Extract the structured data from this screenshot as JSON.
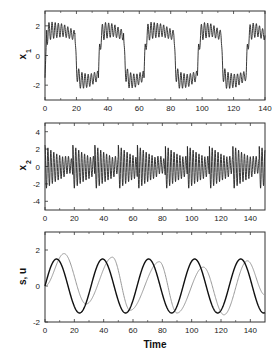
{
  "chart_data": [
    {
      "type": "line",
      "ylabel": "x1",
      "ylabel_main": "x",
      "ylabel_sub": "1",
      "xlabel": "",
      "xlim": [
        0,
        140
      ],
      "ylim": [
        -3,
        3
      ],
      "xticks": [
        0,
        20,
        40,
        60,
        80,
        100,
        120,
        140
      ],
      "yticks": [
        -2,
        0,
        2
      ],
      "frame": {
        "left": 45,
        "top": 11,
        "right": 265,
        "bottom": 100
      },
      "series": [
        {
          "name": "x1",
          "color": "#222222",
          "description": "square-wave-like switching between ~+1.5 and ~-1.5 with fast oscillations; switches near t=19, 34, 50, 63, 82, 97, 112, 128",
          "switch_times": [
            0,
            19,
            34,
            50,
            63,
            82,
            97,
            112,
            128,
            140
          ],
          "levels": [
            1,
            -1,
            1,
            -1,
            1,
            -1,
            1,
            -1,
            1
          ]
        }
      ]
    },
    {
      "type": "line",
      "ylabel": "x2",
      "ylabel_main": "x",
      "ylabel_sub": "2",
      "xlabel": "",
      "xlim": [
        0,
        150
      ],
      "ylim": [
        -5,
        5
      ],
      "xticks": [
        0,
        20,
        40,
        60,
        80,
        100,
        120,
        140
      ],
      "yticks": [
        -4,
        -2,
        0,
        2,
        4
      ],
      "frame": {
        "left": 45,
        "top": 123,
        "right": 265,
        "bottom": 210
      },
      "series": [
        {
          "name": "x2",
          "color": "#222222",
          "description": "fast oscillation amplitude ~1.5-2.5 with decaying bursts resetting at switch times",
          "burst_times": [
            0,
            19,
            34,
            50,
            63,
            82,
            97,
            112,
            128,
            146
          ]
        }
      ]
    },
    {
      "type": "line",
      "ylabel": "s, u",
      "xlabel": "Time",
      "xlim": [
        0,
        150
      ],
      "ylim": [
        -2,
        3
      ],
      "xticks": [
        0,
        20,
        40,
        60,
        80,
        100,
        120,
        140
      ],
      "yticks": [
        -2,
        0,
        2
      ],
      "frame": {
        "left": 45,
        "top": 232,
        "right": 265,
        "bottom": 322
      },
      "series": [
        {
          "name": "s",
          "color": "#111111",
          "width": 1.4,
          "description": "sinusoid amplitude 1.5, period ~31.4",
          "amplitude": 1.5,
          "period": 31.4,
          "phase": 0
        },
        {
          "name": "u",
          "color": "#999999",
          "width": 1.0,
          "description": "lagging sinusoid-like response, peaks ~1.8 at t=13, 1.6 at t=46, 1.35 at t=78, 1.0 at t=108, 1.4 at t=138",
          "peaks": [
            [
              13,
              1.8
            ],
            [
              46,
              1.6
            ],
            [
              78,
              1.35
            ],
            [
              108,
              1.05
            ],
            [
              138,
              1.4
            ]
          ],
          "troughs": [
            [
              28,
              -1.0
            ],
            [
              58,
              -1.35
            ],
            [
              90,
              -1.5
            ],
            [
              122,
              -1.6
            ]
          ]
        }
      ]
    }
  ]
}
